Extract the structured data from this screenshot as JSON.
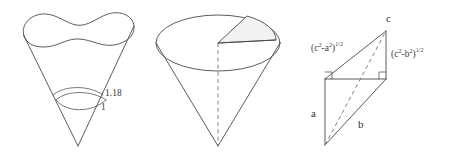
{
  "figure": {
    "name": "three-geometry-diagrams",
    "background_color": "#ffffff",
    "stroke_color": "#4a4a4a",
    "shade_color": "#f2f2f2"
  },
  "panel_wavy_cone": {
    "name": "wavy-rimmed-cone",
    "description": "Cone with a wavy closed curve rim at the top and a narrow band of two nested arcs near the apex",
    "labels": {
      "band_outer": "1.18",
      "band_inner": "1"
    }
  },
  "panel_sector_cone": {
    "name": "cone-with-sector-wedge",
    "description": "Cone with elliptical top face, a shaded sector wedge removed, and a dashed vertical axis to the apex",
    "labels": {}
  },
  "panel_triangle": {
    "name": "right-triangle-construction",
    "description": "Planar construction with two right angles, a dashed diagonal, sides a and b, and hypotenuse labels",
    "labels": {
      "apex": "c",
      "left_side": "a",
      "base_diagonal": "b",
      "upper_left_expr_open": "(c",
      "upper_left_expr_sup1": "2",
      "upper_left_expr_mid": "-a",
      "upper_left_expr_sup2": "2",
      "upper_left_expr_close": ")",
      "upper_left_expr_power": "1/2",
      "upper_right_expr_open": "(c",
      "upper_right_expr_sup1": "2",
      "upper_right_expr_mid": "-b",
      "upper_right_expr_sup2": "2",
      "upper_right_expr_close": ")",
      "upper_right_expr_power": "1/2"
    }
  }
}
